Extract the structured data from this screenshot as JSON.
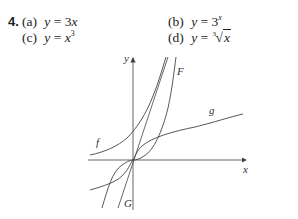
{
  "problem": {
    "number": "4.",
    "parts": [
      {
        "label": "(a)",
        "lhs": "y",
        "eq": "=",
        "rhs": "3x"
      },
      {
        "label": "(b)",
        "lhs": "y",
        "eq": "=",
        "rhs_base": "3",
        "rhs_exp": "x"
      },
      {
        "label": "(c)",
        "lhs": "y",
        "eq": "=",
        "rhs_base": "x",
        "rhs_exp": "3"
      },
      {
        "label": "(d)",
        "lhs": "y",
        "eq": "=",
        "root_index": "3",
        "radicand": "x"
      }
    ]
  },
  "graph": {
    "x_axis_label": "x",
    "y_axis_label": "y",
    "curve_labels": {
      "f": "f",
      "F": "F",
      "g": "g",
      "G": "G"
    },
    "colors": {
      "axis": "#555555",
      "curve": "#444444"
    }
  }
}
